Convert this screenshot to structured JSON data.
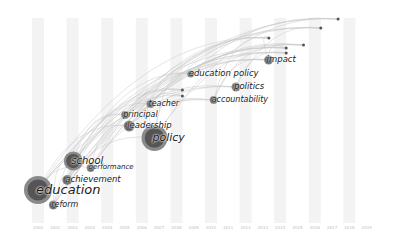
{
  "chart_data": {
    "type": "timezone-network",
    "title": "",
    "x_axis": {
      "label": "",
      "ticks": [
        "2000",
        "2001",
        "2002",
        "2003",
        "2004",
        "2005",
        "2006",
        "2007",
        "2008",
        "2009",
        "2010",
        "2011",
        "2012",
        "2013",
        "2014",
        "2015",
        "2016",
        "2017",
        "2018",
        "2019"
      ]
    },
    "nodes": [
      {
        "label": "education",
        "year": "2000",
        "size": 22,
        "font": 13
      },
      {
        "label": "reform",
        "year": "2001",
        "size": 7,
        "font": 8
      },
      {
        "label": "achievement",
        "year": "2001",
        "size": 8,
        "font": 8.5
      },
      {
        "label": "performance",
        "year": "2002",
        "size": 6,
        "font": 7
      },
      {
        "label": "school",
        "year": "2001",
        "size": 13,
        "font": 10
      },
      {
        "label": "policy",
        "year": "2005",
        "size": 20,
        "font": 11
      },
      {
        "label": "leadership",
        "year": "2004",
        "size": 9,
        "font": 8.5
      },
      {
        "label": "principal",
        "year": "2004",
        "size": 6,
        "font": 8
      },
      {
        "label": "teacher",
        "year": "2005",
        "size": 6,
        "font": 8
      },
      {
        "label": "accountability",
        "year": "2009",
        "size": 6,
        "font": 8
      },
      {
        "label": "politics",
        "year": "2010",
        "size": 7,
        "font": 8.5
      },
      {
        "label": "education policy",
        "year": "2009",
        "size": 5,
        "font": 8.5
      },
      {
        "label": "impact",
        "year": "2012",
        "size": 7,
        "font": 8.5
      }
    ],
    "minor_nodes": [
      {
        "year": "2016",
        "y": 28
      },
      {
        "year": "2015",
        "y": 45
      },
      {
        "year": "2014",
        "y": 48
      },
      {
        "year": "2014",
        "y": 53
      },
      {
        "year": "2017",
        "y": 19
      },
      {
        "year": "2013",
        "y": 38
      },
      {
        "year": "2008",
        "y": 90
      },
      {
        "year": "2008",
        "y": 96
      }
    ],
    "colors": {
      "background": "#ffffff",
      "stripe": "#f3f3f3",
      "node": "#555555",
      "ring": "#8a8a8a",
      "link": "#c8c8c8",
      "label": "#1a1a1a"
    }
  }
}
